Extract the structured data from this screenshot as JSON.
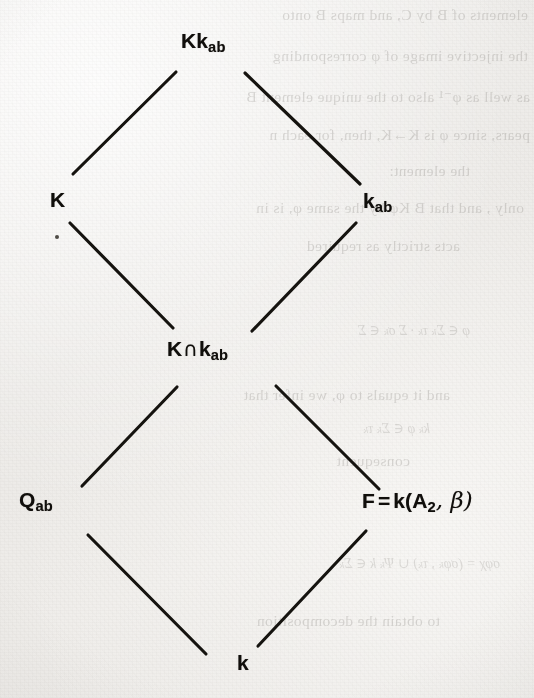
{
  "document": {
    "type": "scanned-book-page",
    "figure_kind": "hasse-diagram",
    "description": "Lattice diagram of field extensions"
  },
  "colors": {
    "paper": "#efeeec",
    "ink": "#15130f",
    "ghost_ink": "#5a5650"
  },
  "diagram": {
    "nodes": [
      {
        "id": "top",
        "label": "Kk",
        "sub": "ab",
        "full_text": "Kk_ab",
        "x": 224,
        "y": 45
      },
      {
        "id": "left",
        "label": "K",
        "sub": "",
        "full_text": "K",
        "x": 62,
        "y": 201
      },
      {
        "id": "right",
        "label": "k",
        "sub": "ab",
        "full_text": "k_ab",
        "x": 381,
        "y": 203
      },
      {
        "id": "mid",
        "label": "K",
        "op": "∩",
        "label2": "k",
        "sub": "ab",
        "full_text": "K ∩ k_ab",
        "x": 213,
        "y": 350
      },
      {
        "id": "lowleft",
        "label": "Q",
        "sub": "ab",
        "full_text": "Q_ab",
        "x": 44,
        "y": 502
      },
      {
        "id": "lowright",
        "label": "F",
        "eq": "=",
        "rhs": "k(A",
        "rhs_sub": "2",
        "rhs_tail": ", β)",
        "full_text": "F = k(A_2, β)",
        "x": 432,
        "y": 502
      },
      {
        "id": "bottom",
        "label": "k",
        "sub": "",
        "full_text": "k",
        "x": 245,
        "y": 663
      }
    ],
    "edges": [
      {
        "from": "left",
        "to": "top",
        "x1": 73,
        "y1": 174,
        "x2": 176,
        "y2": 72
      },
      {
        "from": "top",
        "to": "right",
        "x1": 245,
        "y1": 73,
        "x2": 360,
        "y2": 184
      },
      {
        "from": "mid",
        "to": "left",
        "x1": 70,
        "y1": 223,
        "x2": 173,
        "y2": 328
      },
      {
        "from": "mid",
        "to": "right",
        "x1": 252,
        "y1": 331,
        "x2": 356,
        "y2": 223
      },
      {
        "from": "lowleft",
        "to": "mid",
        "x1": 82,
        "y1": 486,
        "x2": 177,
        "y2": 387
      },
      {
        "from": "mid",
        "to": "lowright",
        "x1": 276,
        "y1": 386,
        "x2": 379,
        "y2": 489
      },
      {
        "from": "bottom",
        "to": "lowleft",
        "x1": 88,
        "y1": 535,
        "x2": 206,
        "y2": 654
      },
      {
        "from": "bottom",
        "to": "lowright",
        "x1": 258,
        "y1": 646,
        "x2": 366,
        "y2": 531
      }
    ]
  },
  "bleed_through": {
    "note": "Faint mirrored show-through text from the reverse side of the page",
    "lines": [
      {
        "text": "elements of B by C, and maps B onto",
        "x": 528,
        "y": 14
      },
      {
        "text": "the injective image of φ corresponding",
        "x": 528,
        "y": 55
      },
      {
        "text": "as well as φ⁻¹ also to the unique element B",
        "x": 530,
        "y": 96
      },
      {
        "text": "pears, since φ is K→K, then, for each n",
        "x": 530,
        "y": 134
      },
      {
        "text": "the element:",
        "x": 470,
        "y": 170
      },
      {
        "text": "only , and that B Kφ by the same φ, is in",
        "x": 524,
        "y": 207
      },
      {
        "text": "acts strictly as required",
        "x": 460,
        "y": 245
      },
      {
        "text": "and it equals to φ, we infer that",
        "x": 450,
        "y": 394
      },
      {
        "text": "consequent",
        "x": 410,
        "y": 460
      },
      {
        "text": "to obtain the decomposition",
        "x": 440,
        "y": 620
      }
    ],
    "math": [
      {
        "text": "φ  ∈  Σₖ  τₖ · Σ  σₖ ∈ Σ",
        "x": 470,
        "y": 330
      },
      {
        "text": "kₖ φ ∈ Σₖ τₖ",
        "x": 430,
        "y": 428
      },
      {
        "text": "σφχ = (σφₖ , τₖ) ∪ Ψₖ k ∈ Σₖ",
        "x": 500,
        "y": 563
      }
    ]
  }
}
